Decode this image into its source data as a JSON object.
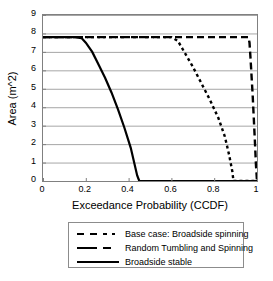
{
  "chart_data": {
    "type": "line",
    "title": "",
    "xlabel": "Exceedance Probability (CCDF)",
    "ylabel": "Area (m^2)",
    "xlim": [
      0,
      1
    ],
    "ylim": [
      0,
      9
    ],
    "grid": true,
    "legend_position": "below-plot",
    "xticks": [
      "0",
      "0.2",
      "0.4",
      "0.6",
      "0.8",
      "1"
    ],
    "xtick_values": [
      0,
      0.2,
      0.4,
      0.6,
      0.8,
      1
    ],
    "yticks": [
      "0",
      "1",
      "2",
      "3",
      "4",
      "5",
      "6",
      "7",
      "8",
      "9"
    ],
    "ytick_values": [
      0,
      1,
      2,
      3,
      4,
      5,
      6,
      7,
      8,
      9
    ],
    "series": [
      {
        "name": "Base case: Broadside spinning",
        "style": "dotted",
        "x": [
          0,
          0.2,
          0.4,
          0.55,
          0.6,
          0.63,
          0.66,
          0.7,
          0.74,
          0.78,
          0.82,
          0.85,
          0.87,
          0.885,
          0.89,
          0.95,
          1.0
        ],
        "values": [
          7.8,
          7.8,
          7.8,
          7.8,
          7.8,
          7.6,
          7.0,
          6.2,
          5.3,
          4.4,
          3.4,
          2.4,
          1.4,
          0.5,
          0.0,
          0.0,
          0.0
        ]
      },
      {
        "name": "Random Tumbling and Spinning",
        "style": "long-dash",
        "x": [
          0,
          0.3,
          0.6,
          0.85,
          0.94,
          0.96,
          0.965,
          0.97,
          0.975,
          0.98,
          0.985,
          0.99,
          0.995,
          1.0
        ],
        "values": [
          7.8,
          7.8,
          7.8,
          7.8,
          7.8,
          7.8,
          7.5,
          6.6,
          5.6,
          4.6,
          3.4,
          2.2,
          0.9,
          0.0
        ]
      },
      {
        "name": "Broadside stable",
        "style": "solid",
        "x": [
          0,
          0.08,
          0.15,
          0.18,
          0.2,
          0.23,
          0.26,
          0.29,
          0.32,
          0.35,
          0.38,
          0.41,
          0.44,
          0.45,
          0.6,
          0.8,
          1.0
        ],
        "values": [
          7.8,
          7.8,
          7.8,
          7.75,
          7.5,
          7.0,
          6.3,
          5.6,
          4.8,
          3.9,
          2.9,
          1.8,
          0.3,
          0.0,
          0.0,
          0.0,
          0.0
        ]
      }
    ]
  },
  "legend": {
    "items": [
      {
        "label": "Base case: Broadside spinning",
        "style": "dotted"
      },
      {
        "label": "Random Tumbling and Spinning",
        "style": "long-dash"
      },
      {
        "label": "Broadside stable",
        "style": "solid"
      }
    ]
  },
  "colors": {
    "line": "#000000",
    "gridline": "#a6a6a6",
    "frame": "#808080",
    "background": "#ffffff"
  }
}
